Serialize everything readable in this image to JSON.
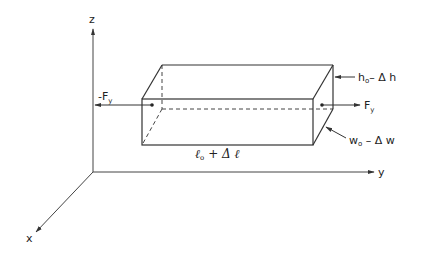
{
  "figure": {
    "type": "3d-axes-with-deformed-bar",
    "colors": {
      "stroke": "#333333",
      "background": "#ffffff"
    },
    "axes": {
      "z": {
        "label": "z"
      },
      "y": {
        "label": "y"
      },
      "x": {
        "label": "x"
      }
    },
    "forces": {
      "left": {
        "label": "-F",
        "subscript": "y"
      },
      "right": {
        "label": "F",
        "subscript": "y"
      }
    },
    "dimensions": {
      "height": {
        "base": "h",
        "sub": "o",
        "rest": "–  Δ h"
      },
      "width": {
        "base": "w",
        "sub": "o",
        "rest": " – Δ w"
      },
      "length": {
        "base": "ℓ",
        "sub": "o",
        "rest": "+ Δ ℓ"
      }
    }
  }
}
